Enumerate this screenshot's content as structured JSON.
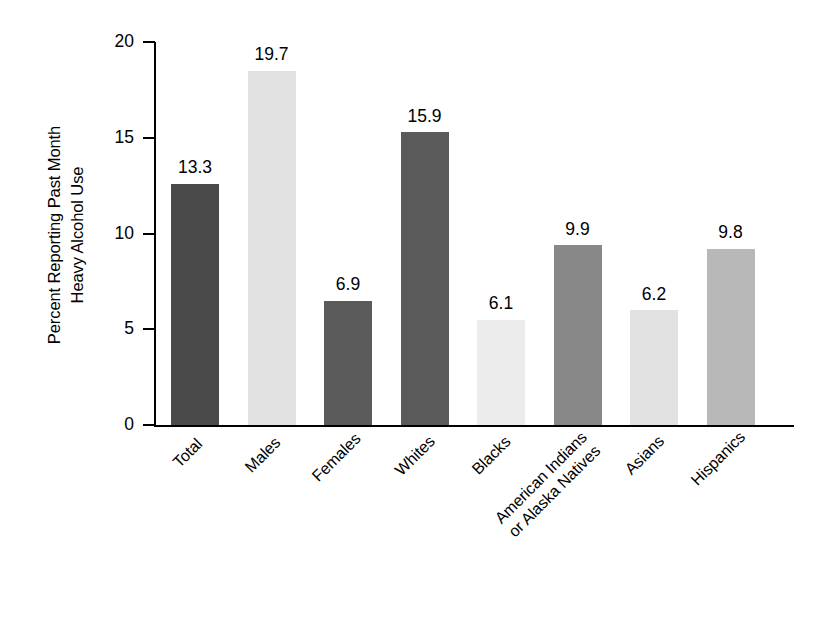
{
  "chart_data": {
    "type": "bar",
    "title": "",
    "xlabel": "",
    "ylabel": "Percent Reporting Past Month\nHeavy Alcohol Use",
    "ylim": [
      0,
      20
    ],
    "yticks": [
      0,
      5,
      10,
      15,
      20
    ],
    "ytick_labels": [
      "0",
      "5",
      "10",
      "15",
      "20"
    ],
    "grid": false,
    "legend": "none",
    "categories": [
      "Total",
      "Males",
      "Females",
      "Whites",
      "Blacks",
      "American Indians\nor Alaska Natives",
      "Asians",
      "Hispanics"
    ],
    "values": [
      13.3,
      19.7,
      6.9,
      15.9,
      6.1,
      9.9,
      6.2,
      9.8
    ],
    "value_labels": [
      "13.3",
      "19.7",
      "6.9",
      "15.9",
      "6.1",
      "9.9",
      "6.2",
      "9.8"
    ],
    "bar_colors": [
      "#4a4a4a",
      "#e2e2e2",
      "#5a5a5a",
      "#5a5a5a",
      "#ececec",
      "#878787",
      "#e2e2e2",
      "#b8b8b8"
    ],
    "plotted_heights": [
      12.6,
      18.5,
      6.5,
      15.3,
      5.5,
      9.4,
      6.0,
      9.2
    ]
  }
}
